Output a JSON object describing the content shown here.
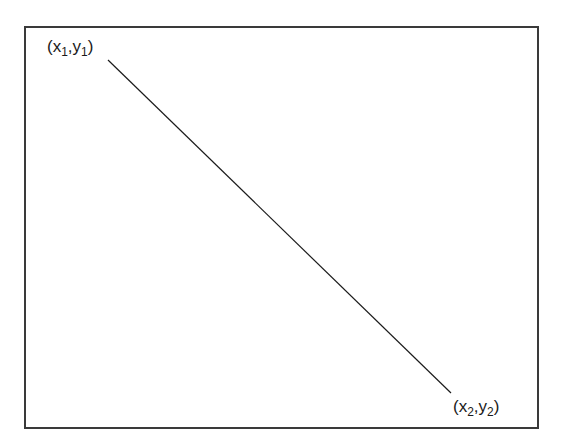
{
  "diagram": {
    "type": "line-segment",
    "frame": {
      "stroke": "#3a3a3a"
    },
    "line": {
      "stroke": "#1a1a1a",
      "x1": 108,
      "y1": 60,
      "x2": 451,
      "y2": 393
    },
    "start_label": {
      "open": "(x",
      "sub1": "1",
      "mid": ",y",
      "sub2": "1",
      "close": ")"
    },
    "end_label": {
      "open": "(x",
      "sub1": "2",
      "mid": ",y",
      "sub2": "2",
      "close": ")"
    }
  }
}
